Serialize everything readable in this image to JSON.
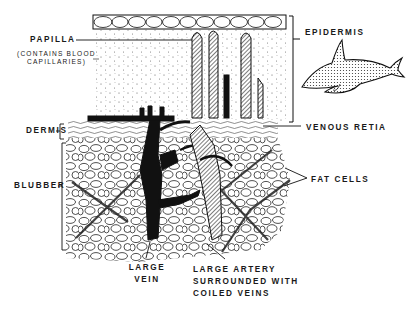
{
  "diagram": {
    "colors": {
      "ink": "#111111",
      "background": "#ffffff",
      "stipple": "#555555"
    },
    "labels": {
      "papilla": "PAPILLA",
      "papilla_note_1": "(CONTAINS BLOOD",
      "papilla_note_2": "CAPILLARIES)",
      "dermis": "DERMIS",
      "blubber": "BLUBBER",
      "epidermis": "EPIDERMIS",
      "venous_retia": "VENOUS RETIA",
      "fat_cells": "FAT CELLS",
      "large_vein_1": "LARGE",
      "large_vein_2": "VEIN",
      "large_artery_1": "LARGE ARTERY",
      "large_artery_2": "SURROUNDED WITH",
      "large_artery_3": "COILED VEINS"
    },
    "inset": {
      "icon": "dolphin-icon"
    }
  }
}
